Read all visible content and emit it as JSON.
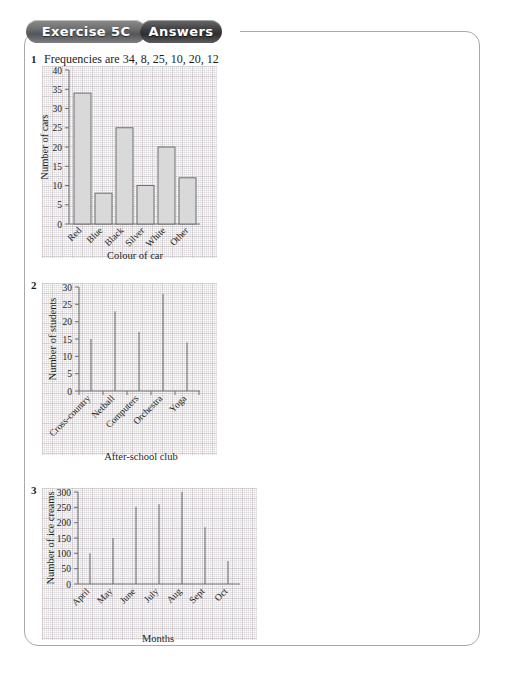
{
  "header": {
    "exercise_label": "Exercise 5C",
    "answers_label": "Answers"
  },
  "questions": [
    {
      "number": "1",
      "text": "Frequencies are 34, 8, 25, 10, 20, 12"
    },
    {
      "number": "2",
      "text": ""
    },
    {
      "number": "3",
      "text": ""
    }
  ],
  "chart_data": [
    {
      "type": "bar",
      "title": "",
      "categories": [
        "Red",
        "Blue",
        "Black",
        "Silver",
        "White",
        "Other"
      ],
      "values": [
        34,
        8,
        25,
        10,
        20,
        12
      ],
      "xlabel": "Colour of car",
      "ylabel": "Number of cars",
      "ylim": [
        0,
        40
      ],
      "yticks": [
        0,
        5,
        10,
        15,
        20,
        25,
        30,
        35,
        40
      ],
      "grid": true,
      "legend": "none"
    },
    {
      "type": "bar",
      "title": "",
      "categories": [
        "Cross-country",
        "Netball",
        "Computers",
        "Orchestra",
        "Yoga"
      ],
      "values": [
        15,
        23,
        17,
        28,
        14
      ],
      "xlabel": "After-school club",
      "ylabel": "Number of students",
      "ylim": [
        0,
        30
      ],
      "yticks": [
        0,
        5,
        10,
        15,
        20,
        25,
        30
      ],
      "grid": true,
      "legend": "none"
    },
    {
      "type": "bar",
      "title": "",
      "categories": [
        "April",
        "May",
        "June",
        "July",
        "Aug",
        "Sept",
        "Oct"
      ],
      "values": [
        100,
        150,
        252,
        260,
        300,
        185,
        75
      ],
      "xlabel": "Months",
      "ylabel": "Number of ice creams",
      "ylim": [
        0,
        300
      ],
      "yticks": [
        0,
        50,
        100,
        150,
        200,
        250,
        300
      ],
      "grid": true,
      "legend": "none"
    }
  ],
  "colors": {
    "bar_fill": "#d9d9d9",
    "bar_stroke": "#6f6f6f",
    "axis": "#6e6e6e",
    "text": "#1d1d1d",
    "frame": "#a9a9ad"
  }
}
